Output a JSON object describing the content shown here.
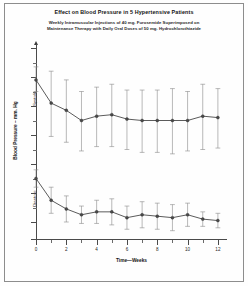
{
  "title": "Effect on Blood Pressure in 5 Hypertensive Patients",
  "subtitle_line_1": "Weekly Intramuscular Injections of 40 mg. Furosemide Superimposed on",
  "subtitle_line_2": "Maintenance Therapy with Daily Oral Doses of 50 mg. Hydrochlorothiazide",
  "axis": {
    "y_title": "Blood Pressure – mm. Hg",
    "x_title": "Time—Weeks",
    "y_ticks": [
      "200",
      "180",
      "160",
      "140",
      "120",
      "100",
      "80",
      "0"
    ],
    "x_ticks": [
      "0",
      "2",
      "4",
      "6",
      "8",
      "10",
      "12"
    ]
  },
  "series_labels": {
    "systolic": "Systolic",
    "diastolic": "Diastolic"
  },
  "chart_data": {
    "type": "line",
    "title": "Effect on Blood Pressure in 5 Hypertensive Patients",
    "subtitle": "Weekly Intramuscular Injections of 40 mg. Furosemide Superimposed on Maintenance Therapy with Daily Oral Doses of 50 mg. Hydrochlorothiazide",
    "xlabel": "Time—Weeks",
    "ylabel": "Blood Pressure – mm. Hg",
    "xlim": [
      0,
      12.6
    ],
    "ylim": [
      0,
      205
    ],
    "y_break": true,
    "y_tick_values": [
      200,
      180,
      160,
      140,
      120,
      100,
      80,
      0
    ],
    "x_tick_values": [
      0,
      2,
      4,
      6,
      8,
      10,
      12
    ],
    "x_minor_step": 1,
    "y_minor_step": 10,
    "grid": false,
    "legend": "none",
    "error_bars": "standard deviation",
    "marker": "filled-circle",
    "x": [
      0,
      1,
      2,
      3,
      4,
      5,
      6,
      7,
      8,
      9,
      10,
      11,
      12
    ],
    "series": [
      {
        "name": "Systolic",
        "values": [
          178,
          162,
          157,
          150,
          153,
          154,
          151,
          150,
          150,
          150,
          150,
          153,
          152
        ],
        "err_up": [
          9,
          22,
          21,
          20,
          20,
          21,
          20,
          21,
          21,
          22,
          20,
          22,
          20
        ],
        "err_down": [
          8,
          23,
          22,
          21,
          21,
          22,
          21,
          22,
          22,
          23,
          21,
          23,
          21
        ]
      },
      {
        "name": "Diastolic",
        "values": [
          110,
          95,
          89,
          85,
          87,
          87,
          83,
          85,
          84,
          83,
          85,
          82,
          81
        ],
        "err_up": [
          6,
          9,
          9,
          6,
          8,
          9,
          8,
          9,
          9,
          9,
          8,
          5,
          5
        ],
        "err_down": [
          6,
          9,
          9,
          6,
          8,
          9,
          8,
          9,
          9,
          9,
          8,
          5,
          5
        ]
      }
    ]
  }
}
